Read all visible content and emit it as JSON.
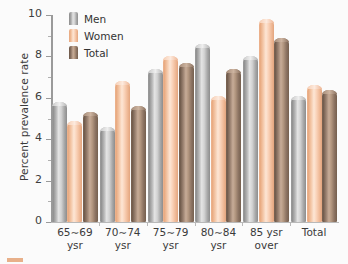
{
  "chart_data": {
    "type": "bar",
    "title": "",
    "xlabel": "",
    "ylabel": "Percent prevalence rate",
    "ylim": [
      0,
      10
    ],
    "yticks": [
      0,
      2,
      4,
      6,
      8,
      10
    ],
    "ytick_labels": [
      "0",
      "2",
      "4",
      "6",
      "8",
      "10"
    ],
    "grid": false,
    "legend_position": "top-left",
    "categories": [
      "65∼69\nysr",
      "70∼74\nysr",
      "75∼79\nysr",
      "80∼84\nysr",
      "85 ysr\nover",
      "Total"
    ],
    "series": [
      {
        "name": "Men",
        "color": "#b5b5b5",
        "values": [
          5.8,
          4.6,
          7.4,
          8.6,
          8.0,
          6.1
        ]
      },
      {
        "name": "Women",
        "color": "#f6c7a7",
        "values": [
          4.9,
          6.8,
          8.0,
          6.1,
          9.8,
          6.6
        ]
      },
      {
        "name": "Total",
        "color": "#8b7260",
        "values": [
          5.3,
          5.6,
          7.7,
          7.4,
          8.9,
          6.4
        ]
      }
    ]
  },
  "legend": {
    "items": [
      {
        "label": "Men"
      },
      {
        "label": "Women"
      },
      {
        "label": "Total"
      }
    ]
  }
}
